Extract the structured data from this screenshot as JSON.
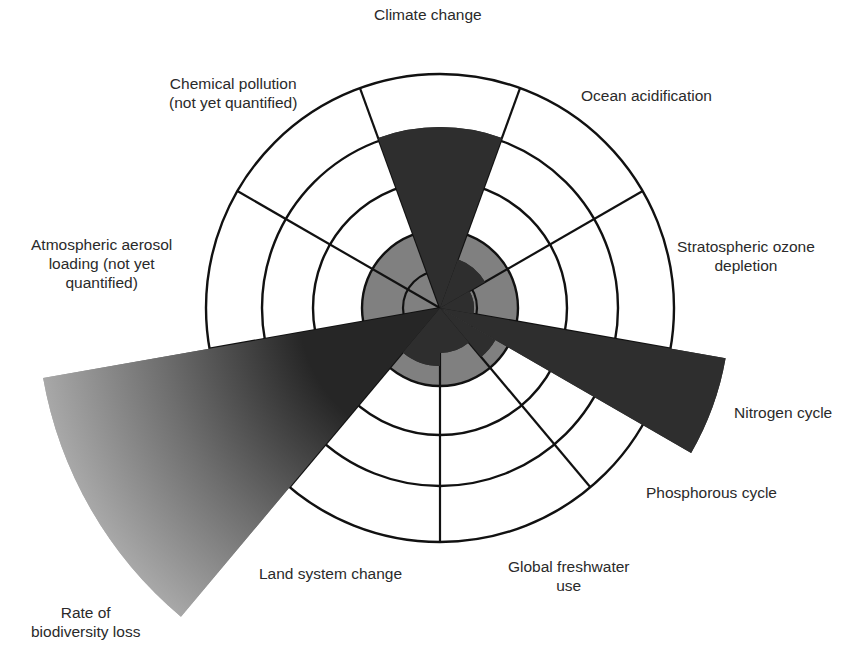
{
  "chart_data": {
    "type": "radial-wedge",
    "title": "",
    "center": [
      440,
      308
    ],
    "rings": [
      37,
      78,
      127,
      178,
      234
    ],
    "safe_zone_radius": 78,
    "spoke_angles_deg": [
      70,
      30,
      -10,
      -50,
      -90,
      -130,
      -170,
      150,
      110
    ],
    "colors": {
      "safe_zone": "#808080",
      "wedge": "#2e2e2e",
      "gradient_start": "#262626",
      "gradient_end": "#a8a8a8",
      "line": "#111111"
    },
    "boundaries": [
      {
        "name": "Climate change",
        "start_deg": 70,
        "end_deg": 110,
        "radius": 181,
        "quantified": true
      },
      {
        "name": "Ocean acidification",
        "start_deg": 30,
        "end_deg": 70,
        "radius": 52,
        "quantified": true
      },
      {
        "name": "Stratospheric ozone depletion",
        "start_deg": -10,
        "end_deg": 30,
        "radius": 34,
        "quantified": true
      },
      {
        "name": "Nitrogen cycle",
        "start_deg": -30,
        "end_deg": -10,
        "radius": 290,
        "quantified": true
      },
      {
        "name": "Phosphorous cycle",
        "start_deg": -50,
        "end_deg": -30,
        "radius": 64,
        "quantified": true
      },
      {
        "name": "Global freshwater use",
        "start_deg": -90,
        "end_deg": -50,
        "radius": 45,
        "quantified": true
      },
      {
        "name": "Land system change",
        "start_deg": -130,
        "end_deg": -90,
        "radius": 58,
        "quantified": true
      },
      {
        "name": "Rate of biodiversity loss",
        "start_deg": -170,
        "end_deg": -130,
        "radius": 403,
        "quantified": true,
        "gradient": true
      },
      {
        "name": "Atmospheric aerosol loading (not yet quantified)",
        "start_deg": 150,
        "end_deg": 190,
        "radius": 0,
        "quantified": false
      },
      {
        "name": "Chemical pollution (not yet quantified)",
        "start_deg": 110,
        "end_deg": 150,
        "radius": 0,
        "quantified": false
      }
    ]
  },
  "labels": {
    "climate": "Climate change",
    "ocean": "Ocean acidification",
    "ozone_1": "Stratospheric ozone",
    "ozone_2": "depletion",
    "nitrogen": "Nitrogen cycle",
    "phosphorous": "Phosphorous cycle",
    "freshwater_1": "Global freshwater",
    "freshwater_2": "use",
    "land": "Land system change",
    "biodiversity_1": "Rate of",
    "biodiversity_2": "biodiversity loss",
    "aerosol_1": "Atmospheric aerosol",
    "aerosol_2": "loading (not yet",
    "aerosol_3": "quantified)",
    "chemical_1": "Chemical pollution",
    "chemical_2": "(not yet quantified)"
  }
}
